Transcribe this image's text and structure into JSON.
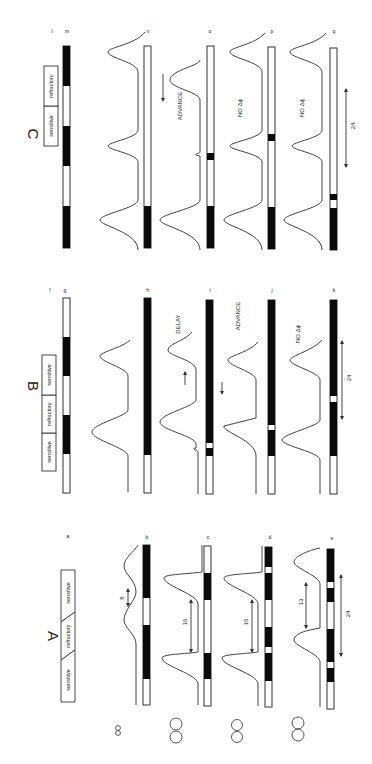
{
  "figure": {
    "orientation": "rotated 90 degrees clockwise",
    "panels": [
      {
        "id": "A",
        "label": "A",
        "header": [
          "sensitive",
          "refractory",
          "sensitive"
        ],
        "rows": [
          {
            "letter": "a",
            "type": "header"
          },
          {
            "letter": "b",
            "annotation": "8",
            "oscillator_icon": "small-double-circle"
          },
          {
            "letter": "c",
            "annotation": "16",
            "oscillator_icon": "double-circle"
          },
          {
            "letter": "d",
            "annotation": "16",
            "oscillator_icon": "double-circle"
          },
          {
            "letter": "e",
            "annotation": "13",
            "period": "24",
            "oscillator_icon": "double-circle-overlapping"
          }
        ]
      },
      {
        "id": "B",
        "label": "B",
        "header": [
          "sensitive",
          "refractory",
          "sensitive"
        ],
        "rows": [
          {
            "letter": "f",
            "type": "header"
          },
          {
            "letter": "g"
          },
          {
            "letter": "h"
          },
          {
            "letter": "i",
            "result": "DELAY"
          },
          {
            "letter": "j",
            "result": "ADVANCE"
          },
          {
            "letter": "k",
            "result": "NO Δϕ",
            "period": "24"
          }
        ]
      },
      {
        "id": "C",
        "label": "C",
        "header": [
          "sensitive",
          "refractory"
        ],
        "rows": [
          {
            "letter": "l",
            "type": "header"
          },
          {
            "letter": "m"
          },
          {
            "letter": "n"
          },
          {
            "letter": "o",
            "result": "ADVANCE"
          },
          {
            "letter": "p",
            "result": "NO Δϕ"
          },
          {
            "letter": "q",
            "result": "NO Δϕ",
            "period": "24"
          }
        ]
      }
    ],
    "labels": {
      "A": "A",
      "B": "B",
      "C": "C",
      "sensitive": "sensitive",
      "refractory": "refractory",
      "delay": "DELAY",
      "advance": "ADVANCE",
      "no_phase_shift": "NO Δϕ",
      "num_8": "8",
      "num_16": "16",
      "num_13": "13",
      "num_24": "24",
      "row_a": "a",
      "row_b": "b",
      "row_c": "c",
      "row_d": "d",
      "row_e": "e",
      "row_f": "f",
      "row_g": "g",
      "row_h": "h",
      "row_i": "i",
      "row_j": "j",
      "row_k": "k",
      "row_l": "l",
      "row_m": "m",
      "row_n": "n",
      "row_o": "o",
      "row_p": "p",
      "row_q": "q"
    },
    "colors": {
      "ink": "#0b0b0b",
      "line": "#444444",
      "background": "#ffffff"
    }
  }
}
